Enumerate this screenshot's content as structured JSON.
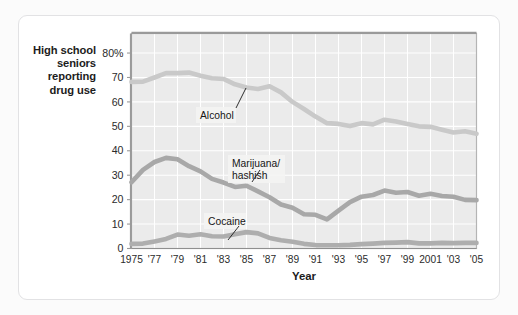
{
  "figure": {
    "background_color": "#fbfbfb",
    "card_color": "#ffffff",
    "card_border_color": "#e2e2e4"
  },
  "axis_titles": {
    "y_line1": "High school",
    "y_line2": "seniors",
    "y_line3": "reporting",
    "y_line4": "drug use",
    "x": "Year"
  },
  "annotations": {
    "alcohol": "Alcohol",
    "marijuana_line1": "Marijuana/",
    "marijuana_line2": "hashish",
    "cocaine": "Cocaine"
  },
  "chart_data": {
    "type": "line",
    "title": "",
    "subtitle": "",
    "xlabel": "Year",
    "ylabel": "High school seniors reporting drug use",
    "xlim": [
      1975,
      2005
    ],
    "ylim": [
      0,
      88
    ],
    "grid": true,
    "grid_color": "#ffffff",
    "plot_background": "#ebebeb",
    "legend_position": "inline-annotations",
    "y_ticks": [
      0,
      10,
      20,
      30,
      40,
      50,
      60,
      70,
      80
    ],
    "y_tick_labels": [
      "0",
      "10",
      "20",
      "30",
      "40",
      "50",
      "60",
      "70",
      "80%"
    ],
    "x_ticks": [
      1975,
      1977,
      1979,
      1981,
      1983,
      1985,
      1987,
      1989,
      1991,
      1993,
      1995,
      1997,
      1999,
      2001,
      2003,
      2005
    ],
    "x_tick_labels": [
      "1975",
      "'77",
      "'79",
      "'81",
      "'83",
      "'85",
      "'87",
      "'89",
      "'91",
      "'93",
      "'95",
      "'97",
      "'99",
      "2001",
      "'03",
      "'05"
    ],
    "x": [
      1975,
      1976,
      1977,
      1978,
      1979,
      1980,
      1981,
      1982,
      1983,
      1984,
      1985,
      1986,
      1987,
      1988,
      1989,
      1990,
      1991,
      1992,
      1993,
      1994,
      1995,
      1996,
      1997,
      1998,
      1999,
      2000,
      2001,
      2002,
      2003,
      2004,
      2005
    ],
    "series": [
      {
        "name": "Alcohol",
        "color": "#c9c9c9",
        "line_width": 4.6,
        "values": [
          68.2,
          68.3,
          70.0,
          71.8,
          71.8,
          72.0,
          70.7,
          69.7,
          69.4,
          67.2,
          65.9,
          65.3,
          66.4,
          63.9,
          60.0,
          57.1,
          54.0,
          51.3,
          51.0,
          50.1,
          51.3,
          50.8,
          52.7,
          52.0,
          51.0,
          50.0,
          49.8,
          48.6,
          47.5,
          48.0,
          47.0
        ]
      },
      {
        "name": "Marijuana/hashish",
        "color": "#a8a8a8",
        "line_width": 4.6,
        "values": [
          27.1,
          32.2,
          35.4,
          37.1,
          36.5,
          33.7,
          31.6,
          28.5,
          27.0,
          25.2,
          25.7,
          23.4,
          21.0,
          18.0,
          16.7,
          14.0,
          13.8,
          11.9,
          15.5,
          19.0,
          21.2,
          21.9,
          23.7,
          22.8,
          23.1,
          21.6,
          22.4,
          21.5,
          21.2,
          19.9,
          19.8
        ]
      },
      {
        "name": "Cocaine",
        "color": "#aeaeae",
        "line_width": 4.6,
        "values": [
          1.9,
          2.0,
          2.9,
          3.9,
          5.7,
          5.2,
          5.8,
          5.0,
          4.9,
          5.8,
          6.7,
          6.2,
          4.3,
          3.4,
          2.8,
          1.9,
          1.4,
          1.3,
          1.3,
          1.5,
          1.8,
          2.0,
          2.3,
          2.4,
          2.6,
          2.1,
          2.1,
          2.3,
          2.2,
          2.3,
          2.3
        ]
      }
    ]
  }
}
